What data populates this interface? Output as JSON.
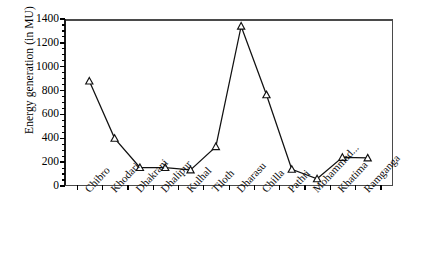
{
  "chart_data": {
    "type": "line",
    "title": "",
    "xlabel": "",
    "ylabel": "Energy generation (in MU)",
    "categories": [
      "Chibro",
      "Khodari",
      "Dhakrani",
      "Dhalipur",
      "Kulhal",
      "Tiloth",
      "Dharasu",
      "Chilla",
      "Pathri",
      "Mohammad...",
      "Khatima",
      "Ramganga"
    ],
    "values": [
      880,
      400,
      155,
      155,
      135,
      330,
      1340,
      765,
      140,
      60,
      240,
      235
    ],
    "series": [
      {
        "name": "Energy generation",
        "values": [
          880,
          400,
          155,
          155,
          135,
          330,
          1340,
          765,
          140,
          60,
          240,
          235
        ],
        "marker": "open-triangle",
        "line_color": "#111111",
        "marker_fill": "#ffffff",
        "marker_edge": "#111111"
      }
    ],
    "ylim": [
      0,
      1400
    ],
    "yticks": [
      0,
      200,
      400,
      600,
      800,
      1000,
      1200,
      1400
    ],
    "ytick_labels": [
      "0",
      "200",
      "400",
      "600",
      "800",
      "1000",
      "1200",
      "1400"
    ],
    "y_minor_interval": 50,
    "grid": false,
    "legend": null,
    "frame": true,
    "xtick_label_rotation": -47
  },
  "caption": {
    "text": ""
  }
}
